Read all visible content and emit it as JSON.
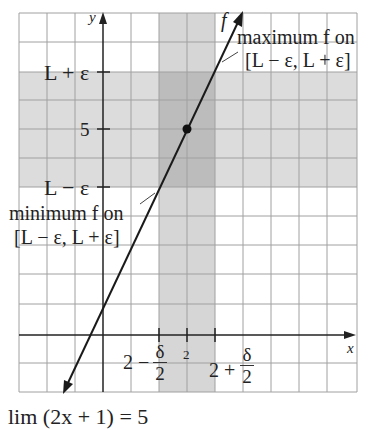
{
  "figure": {
    "axes": {
      "x_label": "x",
      "y_label": "y"
    },
    "function_label": "f",
    "y_ticks": [
      {
        "label": "L + ε",
        "value": "L+eps"
      },
      {
        "label": "5",
        "value": 5
      },
      {
        "label": "L − ε",
        "value": "L-eps"
      }
    ],
    "x_ticks": {
      "center": "2",
      "left": {
        "prefix": "2 −",
        "num": "δ",
        "den": "2"
      },
      "right": {
        "prefix": "2 +",
        "num": "δ",
        "den": "2"
      }
    },
    "annotations": {
      "max_line1": "maximum f on",
      "max_line2": "[L − ε, L + ε]",
      "min_line1": "minimum f on",
      "min_line2": "[L − ε, L + ε]"
    },
    "point": {
      "x": 2,
      "y": 5
    },
    "caption": "lim (2x + 1) = 5",
    "colors": {
      "grid": "#9a9a9a",
      "band": "#d9d9d9",
      "overlap": "#bdbdbd",
      "line": "#1a1a1a"
    }
  }
}
